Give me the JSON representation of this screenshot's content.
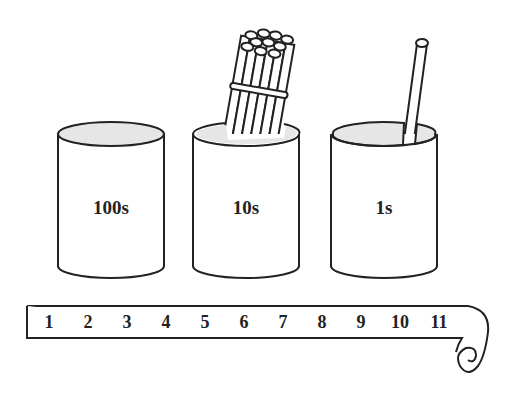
{
  "cups": [
    {
      "label": "100s",
      "sticks": 0
    },
    {
      "label": "10s",
      "sticks": 10,
      "bundled": true
    },
    {
      "label": "1s",
      "sticks": 1
    }
  ],
  "number_strip": {
    "numbers": [
      "1",
      "2",
      "3",
      "4",
      "5",
      "6",
      "7",
      "8",
      "9",
      "10",
      "11"
    ]
  },
  "colors": {
    "stroke": "#222222",
    "cup_opening": "#e6e6e6",
    "background": "#ffffff"
  }
}
